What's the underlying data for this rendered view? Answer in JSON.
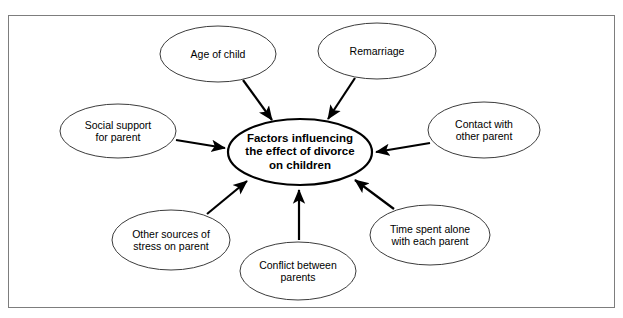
{
  "diagram": {
    "type": "spider-concept-map",
    "frame": {
      "border_color": "#7d7d7d"
    },
    "center": {
      "label": "Factors influencing\nthe effect of divorce\non children",
      "cx": 300,
      "cy": 152,
      "rx": 72,
      "ry": 33,
      "stroke": "#000000",
      "stroke_width": 2.2,
      "fill": "#ffffff"
    },
    "satellites": [
      {
        "name": "age-of-child",
        "label": "Age of child",
        "cx": 218,
        "cy": 54,
        "rx": 58,
        "ry": 28,
        "arrow": {
          "x1": 243,
          "y1": 80,
          "x2": 272,
          "y2": 120
        }
      },
      {
        "name": "remarriage",
        "label": "Remarriage",
        "cx": 377,
        "cy": 51,
        "rx": 59,
        "ry": 28,
        "arrow": {
          "x1": 355,
          "y1": 78,
          "x2": 328,
          "y2": 119
        }
      },
      {
        "name": "contact-with-other-parent",
        "label": "Contact with\nother parent",
        "cx": 484,
        "cy": 130,
        "rx": 56,
        "ry": 28,
        "arrow": {
          "x1": 430,
          "y1": 143,
          "x2": 376,
          "y2": 152
        }
      },
      {
        "name": "time-spent-alone-with-each-parent",
        "label": "Time spent alone\nwith each parent",
        "cx": 430,
        "cy": 235,
        "rx": 60,
        "ry": 30,
        "arrow": {
          "x1": 394,
          "y1": 209,
          "x2": 355,
          "y2": 180
        }
      },
      {
        "name": "conflict-between-parents",
        "label": "Conflict between\nparents",
        "cx": 298,
        "cy": 271,
        "rx": 58,
        "ry": 29,
        "arrow": {
          "x1": 299,
          "y1": 240,
          "x2": 299,
          "y2": 190
        }
      },
      {
        "name": "other-sources-of-stress-on-parent",
        "label": "Other sources of\nstress on parent",
        "cx": 171,
        "cy": 240,
        "rx": 59,
        "ry": 30,
        "arrow": {
          "x1": 207,
          "y1": 214,
          "x2": 247,
          "y2": 181
        }
      },
      {
        "name": "social-support-for-parent",
        "label": "Social support\nfor parent",
        "cx": 118,
        "cy": 131,
        "rx": 58,
        "ry": 27,
        "arrow": {
          "x1": 176,
          "y1": 140,
          "x2": 225,
          "y2": 148
        }
      }
    ],
    "styles": {
      "satellite_stroke": "#3c3c3c",
      "satellite_stroke_width": 1,
      "arrow_color": "#000000",
      "arrow_width": 2.2
    }
  }
}
